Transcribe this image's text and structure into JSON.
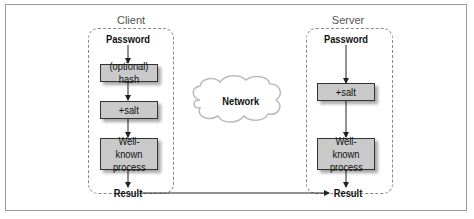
{
  "diagram": {
    "client": {
      "title": "Client",
      "password": "Password",
      "step1": "(optional) hash",
      "step2": "+salt",
      "step3_line1": "Well-known",
      "step3_line2": "process",
      "result": "Result"
    },
    "server": {
      "title": "Server",
      "password": "Password",
      "step1": "+salt",
      "step2_line1": "Well-known",
      "step2_line2": "process",
      "result": "Result"
    },
    "network": {
      "label": "Network"
    },
    "edges": [
      {
        "from": "client.password",
        "to": "client.step1"
      },
      {
        "from": "client.step1",
        "to": "client.step2"
      },
      {
        "from": "client.step2",
        "to": "client.step3"
      },
      {
        "from": "client.step3",
        "to": "client.result"
      },
      {
        "from": "server.password",
        "to": "server.step1"
      },
      {
        "from": "server.step1",
        "to": "server.step2"
      },
      {
        "from": "server.step2",
        "to": "server.result"
      },
      {
        "from": "client.result",
        "to": "server.result"
      }
    ],
    "colors": {
      "box_fill": "#c9c9c9",
      "dashed_border": "#888888",
      "cloud_fill": "#ffffff"
    }
  }
}
